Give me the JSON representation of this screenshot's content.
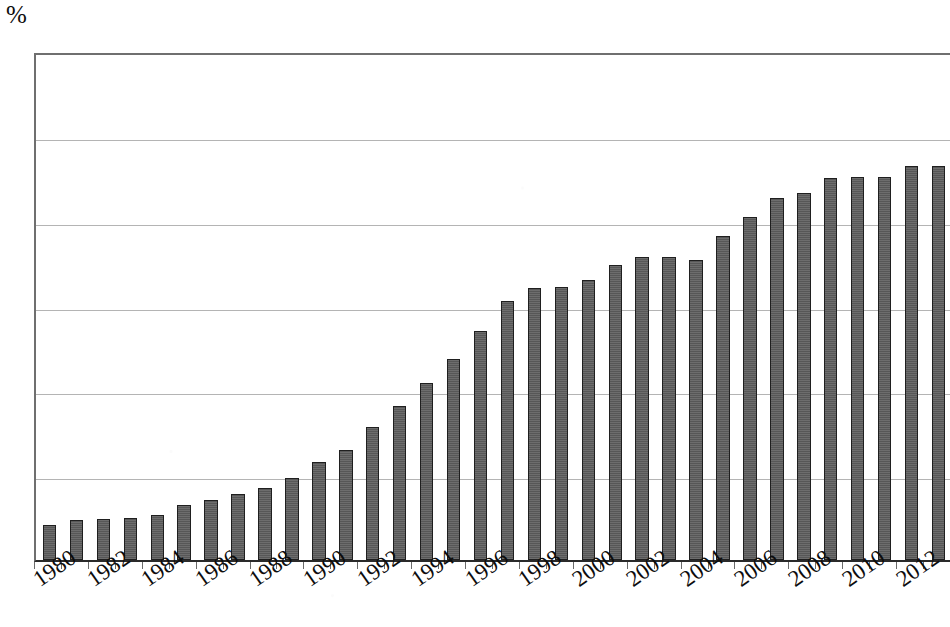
{
  "chart_data": {
    "type": "bar",
    "title": "",
    "subtitle": "",
    "xlabel": "",
    "ylabel": "%",
    "unit_label": "%",
    "ylim": [
      0,
      60
    ],
    "ytick_step": 10,
    "ytick_labels": [
      "0",
      "10",
      "20",
      "30",
      "40",
      "50",
      "60"
    ],
    "ytick_values": [
      0,
      10,
      20,
      30,
      40,
      50,
      60
    ],
    "grid": true,
    "grid_orientation": "horizontal",
    "legend": null,
    "legend_position": "none",
    "bar_color": "#5c5c5c",
    "bar_edge_color": "#1f1f1f",
    "background_color": "#ffffff",
    "axis_color": "#2a2a2a",
    "gridline_color": "#b4b4b4",
    "xtick_label_rotation": -35,
    "xtick_labels_shown": [
      "1980",
      "1982",
      "1984",
      "1986",
      "1988",
      "1990",
      "1992",
      "1994",
      "1996",
      "1998",
      "2000",
      "2002",
      "2004",
      "2006",
      "2008",
      "2010",
      "2012"
    ],
    "categories": [
      "1980",
      "1981",
      "1982",
      "1983",
      "1984",
      "1985",
      "1986",
      "1987",
      "1988",
      "1989",
      "1990",
      "1991",
      "1992",
      "1993",
      "1994",
      "1995",
      "1996",
      "1997",
      "1998",
      "1999",
      "2000",
      "2001",
      "2002",
      "2003",
      "2004",
      "2005",
      "2006",
      "2007",
      "2008",
      "2009",
      "2010",
      "2011",
      "2012",
      "2013"
    ],
    "values": [
      4.1,
      4.7,
      4.8,
      5.0,
      5.3,
      6.5,
      7.1,
      7.8,
      8.5,
      9.7,
      11.5,
      13.0,
      15.7,
      18.2,
      20.9,
      23.7,
      27.0,
      30.5,
      32.1,
      32.2,
      33.0,
      34.8,
      35.7,
      35.7,
      35.4,
      38.2,
      40.4,
      42.7,
      43.3,
      45.0,
      45.1,
      45.1,
      46.5,
      46.5
    ]
  }
}
